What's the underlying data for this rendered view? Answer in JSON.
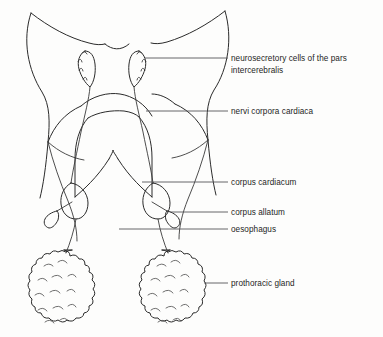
{
  "figure": {
    "background_color": "#fdfdfc",
    "line_color": "#2b2b2b",
    "label_color": "#1d1d1d",
    "leader_color": "#55565a"
  },
  "labels": [
    {
      "id": "neurosecretory-cells",
      "line1": "neurosecretory cells of the pars",
      "line2": "intercerebralis",
      "text_x": 231,
      "text_y": 61,
      "leader": "M 224 58 L 145 58"
    },
    {
      "id": "nervi-corpora-cardiaca",
      "line1": "nervi corpora cardiaca",
      "line2": "",
      "text_x": 231,
      "text_y": 114,
      "leader": "M 224 111 L 146 111"
    },
    {
      "id": "corpus-cardiacum",
      "line1": "corpus cardiacum",
      "line2": "",
      "text_x": 231,
      "text_y": 184,
      "leader": "M 224 181 L 142 181"
    },
    {
      "id": "corpus-allatum",
      "line1": "corpus allatum",
      "line2": "",
      "text_x": 231,
      "text_y": 215,
      "leader": "M 224 212 L 170 212"
    },
    {
      "id": "oesophagus",
      "line1": "oesophagus",
      "line2": "",
      "text_x": 231,
      "text_y": 231,
      "leader": "M 224 228 L 119 228"
    },
    {
      "id": "prothoracic-gland",
      "line1": "prothoracic gland",
      "line2": "",
      "text_x": 231,
      "text_y": 285,
      "leader": "M 224 282 L 206 282"
    }
  ],
  "structures": {
    "head_outline_left": "M 31 13 C 22 40 28 70 42 92 C 50 105 50 120 48 140 C 46 165 43 185 40 197",
    "head_outline_right": "M 225 11 C 232 38 228 68 214 90 C 206 103 206 118 208 138 C 210 162 213 182 216 194",
    "antenna_left": "M 31 13 C 48 26 68 37 88 43 C 96 45 100 45 104 44",
    "antenna_right": "M 225 11 C 208 24 188 36 168 42 C 160 44 156 44 152 43",
    "head_top_notch": "M 104 44 C 112 49 120 50 128 44",
    "brain_left_lobe": "M 48 140 C 55 125 66 112 82 105",
    "brain_right_lobe": "M 208 138 C 201 123 190 110 174 103",
    "brain_center": "M 82 105 C 96 98 116 97 130 103 C 144 109 152 120 156 131",
    "optic_arc_left": "M 48 140 C 60 150 72 157 84 160",
    "ganglion_outline": "M 86 118 C 78 128 74 142 74 158 L 74 196",
    "ganglion_outline_r": "M 140 117 C 148 127 152 141 152 157 L 152 196",
    "ganglion_bottom_left": "M 74 196 C 82 190 96 178 108 160",
    "ganglion_bottom_right": "M 152 196 C 144 190 130 178 118 160",
    "ganglion_notch": "M 108 160 C 111 155 113 152 113 150 C 113 152 115 155 118 160",
    "nsc_left": "M 84 52 C 79 55 78 62 80 68 C 81 74 85 80 90 84 C 94 80 96 72 95 64 C 94 57 90 52 84 52 Z",
    "nsc_right": "M 139 52 C 144 55 145 62 143 68 C 142 74 138 80 133 84 C 129 80 127 72 128 64 C 129 57 133 52 139 52 Z",
    "nsc_left_bumps": "M 82 54 q 3 -4 5 0 M 79 60 q 3 -4 4 1 M 79 68 q 3 -4 4 1 M 82 76 q 3 -4 4 1",
    "nsc_right_bumps": "M 141 54 q -3 -4 -5 0 M 144 60 q -3 -4 -4 1 M 144 68 q -3 -4 -4 1 M 141 76 q -3 -4 -4 1",
    "ncc_left": "M 90 84 C 88 96 84 112 80 130 C 76 150 72 168 70 182",
    "ncc_right": "M 133 84 C 135 96 139 112 143 130 C 147 150 151 168 153 182",
    "cc_left": "M 70 182 C 64 186 60 194 61 203 C 62 212 68 218 76 218 C 83 218 88 211 88 202 C 88 192 80 183 70 182 Z",
    "cc_right": "M 153 182 C 147 186 143 194 144 203 C 145 212 151 218 159 218 C 166 218 171 211 171 202 C 171 192 163 183 153 182 Z",
    "ca_left": "M 60 208 C 54 212 48 216 45 219 C 42 222 43 227 47 228 C 51 229 55 225 57 221 C 59 217 60 212 60 208 Z",
    "ca_right": "M 171 208 C 177 212 183 216 186 219 C 189 222 188 227 184 228 C 180 229 176 225 174 221 C 172 217 171 212 171 208 Z",
    "ca_stalk_left": "M 70 200 C 66 203 62 206 58 209",
    "ca_stalk_right": "M 153 200 C 157 203 161 206 165 209",
    "nerve_to_gland_left": "M 76 218 C 74 230 70 242 66 252",
    "nerve_to_gland_right": "M 159 218 C 161 230 164 242 168 252",
    "oesophagus_left": "M 48 140 C 52 160 58 180 66 200 C 72 215 74 228 74 240",
    "oesophagus_right": "M 208 138 C 204 160 198 180 190 200 C 184 215 182 228 182 240",
    "gland_left": "M 66 252 C 50 250 36 256 28 268 C 20 280 18 296 22 310 C 26 324 38 332 52 332 C 68 332 80 322 84 308 C 88 292 84 272 74 260 C 72 256 69 253 66 252 Z",
    "gland_right": "M 168 252 C 184 250 198 256 206 268 C 214 280 216 296 212 310 C 208 324 196 332 182 332 C 166 332 154 322 150 308 C 146 292 150 272 160 260 C 162 256 165 253 168 252 Z"
  }
}
